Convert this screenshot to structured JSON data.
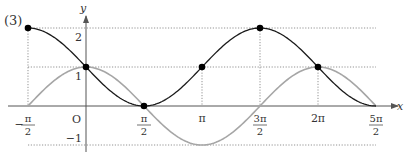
{
  "panel_label": "(3)",
  "axes": {
    "x_label": "x",
    "y_label": "y",
    "origin_label": "O"
  },
  "x_ticks": [
    {
      "value": -1.5707963,
      "num": "π",
      "den": "2",
      "sign": "−",
      "kind": "frac"
    },
    {
      "value": 1.5707963,
      "num": "π",
      "den": "2",
      "sign": "",
      "kind": "frac"
    },
    {
      "value": 3.1415926,
      "text": "π",
      "kind": "plain"
    },
    {
      "value": 4.7123889,
      "num": "3π",
      "den": "2",
      "sign": "",
      "kind": "frac"
    },
    {
      "value": 6.2831853,
      "text": "2π",
      "kind": "plain"
    },
    {
      "value": 7.8539816,
      "num": "5π",
      "den": "2",
      "sign": "",
      "kind": "frac"
    }
  ],
  "y_ticks": [
    {
      "value": 2,
      "text": "2"
    },
    {
      "value": 1,
      "text": "1"
    },
    {
      "value": -1,
      "text": "−1"
    }
  ],
  "colors": {
    "axis": "#555555",
    "black_curve": "#1a1a1a",
    "gray_curve": "#a6a6a6",
    "guide": "#777777",
    "point": "#000000"
  },
  "chart_data": {
    "type": "line",
    "title": "(3)",
    "xlabel": "x",
    "ylabel": "y",
    "xlim": [
      -1.5708,
      7.854
    ],
    "ylim": [
      -1,
      2
    ],
    "grid": false,
    "legend": null,
    "series": [
      {
        "name": "y = 1 − sin x",
        "style": "black",
        "x": [
          -1.5708,
          -0.7854,
          0,
          0.7854,
          1.5708,
          2.3562,
          3.1416,
          3.927,
          4.7124,
          5.4978,
          6.2832,
          7.0686,
          7.854
        ],
        "y": [
          2,
          1.707,
          1,
          0.293,
          0,
          0.293,
          1,
          1.707,
          2,
          1.707,
          1,
          0.293,
          0
        ]
      },
      {
        "name": "y = cos x",
        "style": "gray",
        "x": [
          -1.5708,
          -0.7854,
          0,
          0.7854,
          1.5708,
          2.3562,
          3.1416,
          3.927,
          4.7124,
          5.4978,
          6.2832,
          7.0686,
          7.854
        ],
        "y": [
          0,
          0.707,
          1,
          0.707,
          0,
          -0.707,
          -1,
          -0.707,
          0,
          0.707,
          1,
          0.707,
          0
        ]
      }
    ],
    "marked_points": [
      {
        "x": -1.5708,
        "y": 2
      },
      {
        "x": 0,
        "y": 1
      },
      {
        "x": 1.5708,
        "y": 0
      },
      {
        "x": 3.1416,
        "y": 1
      },
      {
        "x": 4.7124,
        "y": 2
      },
      {
        "x": 6.2832,
        "y": 1
      }
    ],
    "guide_lines": {
      "horizontal_y": [
        2,
        1,
        -1
      ],
      "vertical_x": [
        -1.5708,
        3.1416,
        4.7124,
        6.2832
      ]
    },
    "x_tick_labels": [
      "−π/2",
      "O",
      "π/2",
      "π",
      "3π/2",
      "2π",
      "5π/2"
    ],
    "y_tick_labels": [
      "2",
      "1",
      "−1"
    ]
  }
}
